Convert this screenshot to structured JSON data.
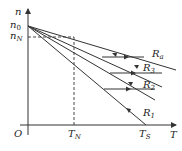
{
  "diagram": {
    "type": "speed-torque characteristic",
    "axes": {
      "y_label": "n",
      "x_label": "T",
      "origin_label": "O"
    },
    "y_ticks": [
      {
        "name": "n0",
        "base": "n",
        "sub": "0"
      },
      {
        "name": "nN",
        "base": "n",
        "sub": "N"
      }
    ],
    "x_ticks": [
      {
        "name": "TN",
        "base": "T",
        "sub": "N"
      },
      {
        "name": "TS",
        "base": "T",
        "sub": "S"
      }
    ],
    "curves": [
      {
        "id": "R1",
        "base": "R",
        "sub": "1"
      },
      {
        "id": "R2",
        "base": "R",
        "sub": "2"
      },
      {
        "id": "R3",
        "base": "R",
        "sub": "3"
      },
      {
        "id": "Ra",
        "base": "R",
        "sub": "a"
      }
    ],
    "colors": {
      "line": "#333333",
      "background": "#ffffff"
    }
  }
}
